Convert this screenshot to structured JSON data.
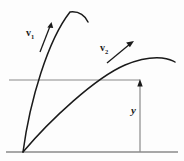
{
  "figure": {
    "kind": "projectile-motion-diagram",
    "title": "",
    "background_color": "#fdfdfd",
    "stroke_color": "#1a1a1a",
    "rule_color": "#8a8a8a",
    "width": 184,
    "height": 161
  },
  "labels": {
    "v1": {
      "symbol": "v",
      "subscript": "1",
      "text": "v1"
    },
    "v2": {
      "symbol": "v",
      "subscript": "2",
      "text": "v2"
    },
    "height": {
      "text": "y"
    }
  },
  "chart_data": {
    "type": "line",
    "title": "",
    "xlabel": "",
    "ylabel": "",
    "grid": false,
    "legend": "none",
    "annotations": [
      {
        "name": "v1",
        "label": "v1",
        "at": [
          44,
          34
        ],
        "points_to": [
          52,
          22
        ]
      },
      {
        "name": "v2",
        "label": "v2",
        "at": [
          118,
          50
        ],
        "points_to": [
          133,
          41
        ]
      },
      {
        "name": "y",
        "label": "y",
        "at": [
          134,
          110
        ]
      }
    ],
    "series": [
      {
        "name": "trajectory-1",
        "launch_point": [
          23,
          152
        ],
        "apex": [
          70,
          12
        ],
        "end": [
          88,
          22
        ],
        "path": "M23,152 C30,100 48,40 70,12 C79,11 85,16 88,22"
      },
      {
        "name": "trajectory-2",
        "launch_point": [
          23,
          152
        ],
        "apex": [
          150,
          58
        ],
        "end": [
          175,
          62
        ],
        "path": "M23,152 C50,120 95,78 125,65 C142,58 152,57 162,58 C168,59 172,60 175,62"
      }
    ],
    "reference_lines": [
      {
        "name": "ground-line",
        "orientation": "horizontal",
        "from": [
          6,
          152
        ],
        "to": [
          178,
          152
        ]
      },
      {
        "name": "height-reference-line",
        "orientation": "horizontal",
        "from": [
          9,
          80
        ],
        "to": [
          140,
          80
        ]
      }
    ],
    "measures": [
      {
        "name": "height-y",
        "label": "y",
        "from": [
          140,
          152
        ],
        "to": [
          140,
          80
        ],
        "arrow": "up"
      }
    ]
  }
}
